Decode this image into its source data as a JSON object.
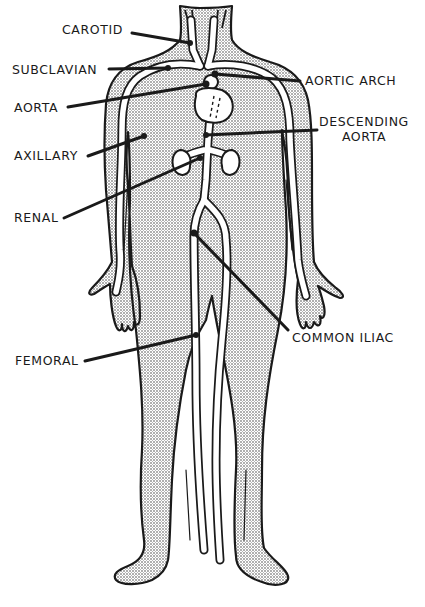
{
  "diagram": {
    "colors": {
      "ink": "#1a1a1a",
      "body_fill_stipple": "#9a9a9a",
      "vessel": "#ffffff",
      "background": "#ffffff"
    },
    "labels": [
      {
        "id": "carotid",
        "text": "CAROTID",
        "side": "left"
      },
      {
        "id": "subclavian",
        "text": "SUBCLAVIAN",
        "side": "left"
      },
      {
        "id": "aorta",
        "text": "AORTA",
        "side": "left"
      },
      {
        "id": "axillary",
        "text": "AXILLARY",
        "side": "left"
      },
      {
        "id": "renal",
        "text": "RENAL",
        "side": "left"
      },
      {
        "id": "femoral",
        "text": "FEMORAL",
        "side": "left"
      },
      {
        "id": "aortic_arch",
        "text": "AORTIC ARCH",
        "side": "right"
      },
      {
        "id": "descending_aorta_line1",
        "text": "DESCENDING",
        "side": "right"
      },
      {
        "id": "descending_aorta_line2",
        "text": "AORTA",
        "side": "right"
      },
      {
        "id": "common_iliac",
        "text": "COMMON ILIAC",
        "side": "right"
      }
    ]
  }
}
